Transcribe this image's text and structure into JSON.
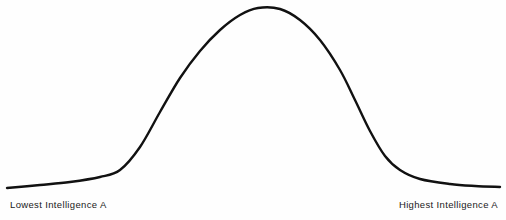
{
  "figure": {
    "name": "bell-curve-distribution",
    "background_color": "#fefefe",
    "curve_color": "#111111",
    "curve_width_px": 2.4
  },
  "labels": {
    "left": "Lowest Intelligence A",
    "right": "Highest Intelligence A"
  },
  "chart_data": {
    "type": "line",
    "title": "",
    "subtitle": "",
    "xlabel": "",
    "ylabel": "",
    "grid": false,
    "legend": null,
    "axis_ticks_visible": false,
    "annotations": [
      {
        "text": "Lowest Intelligence A",
        "position": "bottom-left"
      },
      {
        "text": "Highest Intelligence A",
        "position": "bottom-right"
      }
    ],
    "distribution": "normal",
    "xlim": [
      0,
      100
    ],
    "ylim": [
      0,
      1
    ],
    "mean": 50,
    "std_dev": 15,
    "x": [
      0,
      5,
      10,
      15,
      20,
      25,
      30,
      35,
      40,
      45,
      50,
      55,
      60,
      65,
      70,
      75,
      80,
      85,
      90,
      95,
      100
    ],
    "y": [
      0.004,
      0.01,
      0.021,
      0.043,
      0.081,
      0.143,
      0.236,
      0.361,
      0.506,
      0.648,
      0.757,
      0.806,
      0.786,
      0.701,
      0.571,
      0.427,
      0.292,
      0.182,
      0.103,
      0.053,
      0.025
    ],
    "series": [
      {
        "name": "intelligence-distribution",
        "values": [
          0.004,
          0.01,
          0.021,
          0.043,
          0.081,
          0.143,
          0.236,
          0.361,
          0.506,
          0.648,
          0.757,
          0.806,
          0.786,
          0.701,
          0.571,
          0.427,
          0.292,
          0.182,
          0.103,
          0.053,
          0.025
        ]
      }
    ],
    "path_points_px": [
      [
        7,
        188
      ],
      [
        40,
        185
      ],
      [
        70,
        182
      ],
      [
        100,
        177
      ],
      [
        120,
        170
      ],
      [
        140,
        147
      ],
      [
        160,
        112
      ],
      [
        180,
        78
      ],
      [
        200,
        51
      ],
      [
        220,
        30
      ],
      [
        240,
        15
      ],
      [
        258,
        8
      ],
      [
        280,
        9
      ],
      [
        300,
        20
      ],
      [
        320,
        40
      ],
      [
        340,
        70
      ],
      [
        355,
        100
      ],
      [
        370,
        131
      ],
      [
        385,
        156
      ],
      [
        400,
        170
      ],
      [
        420,
        179
      ],
      [
        450,
        184
      ],
      [
        475,
        186
      ],
      [
        500,
        187
      ]
    ]
  }
}
